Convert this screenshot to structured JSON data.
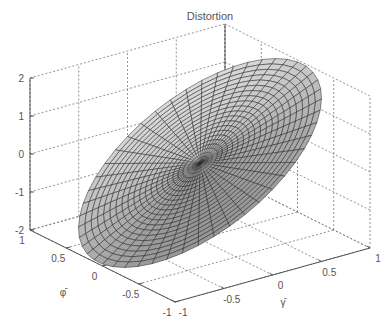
{
  "chart_data": {
    "type": "surface3d",
    "title": "Distortion",
    "xlabel": "γ̄",
    "ylabel": "φ̄",
    "zlabel": "",
    "xlim": [
      -1,
      1
    ],
    "ylim": [
      -1,
      1
    ],
    "zlim": [
      -2,
      2
    ],
    "x_ticks": [
      "-1",
      "-0.5",
      "0",
      "0.5",
      "1"
    ],
    "y_ticks": [
      "1",
      "0.5",
      "0",
      "-0.5",
      "-1"
    ],
    "z_ticks": [
      "2",
      "1",
      "0",
      "-1",
      "-2"
    ],
    "grid": true,
    "surface": "polar-mesh disk tilted plane, radius 1, z ≈ 2·γ̄ (tilted from z=-2 at γ̄=-1 to z=+2 at γ̄=+1), gray shading, dense mesh near origin",
    "colormap": "gray"
  },
  "labels": {
    "title": "Distortion",
    "xlabel": "γ̄",
    "ylabel": "φ̄"
  }
}
